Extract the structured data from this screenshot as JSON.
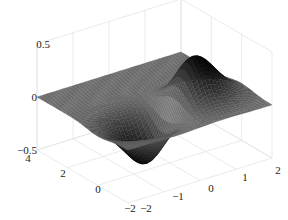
{
  "chart_data": {
    "type": "surface3d",
    "title": "",
    "function": "z = x * exp(-x^2 - y^2)",
    "xlabel": "",
    "ylabel": "",
    "zlabel": "",
    "xlim": [
      -2,
      2
    ],
    "ylim": [
      -2,
      4
    ],
    "zlim": [
      -0.5,
      0.5
    ],
    "xticks": [
      -2,
      -1,
      0,
      1,
      2
    ],
    "yticks": [
      -2,
      0,
      2,
      4
    ],
    "zticks": [
      -0.5,
      0,
      0.5
    ],
    "xtick_labels": [
      "−2",
      "−1",
      "0",
      "1",
      "2"
    ],
    "ytick_labels": [
      "−2",
      "0",
      "2",
      "4"
    ],
    "ztick_labels": [
      "−0.5",
      "0",
      "0.5"
    ],
    "grid": true,
    "colormap": "gray",
    "features": [
      {
        "name": "peak",
        "x": 0.707,
        "y": 0,
        "z": 0.429
      },
      {
        "name": "trough",
        "x": -0.707,
        "y": 0,
        "z": -0.429
      }
    ],
    "x_mesh": [
      -2,
      2,
      40
    ],
    "y_mesh": [
      -2,
      4,
      60
    ]
  },
  "colors": {
    "background": "#ffffff",
    "grid": "#e4e4e4",
    "axis_text": "#222222",
    "surface_low": "#111111",
    "surface_mid": "#6a6a6a",
    "surface_high": "#111111"
  }
}
